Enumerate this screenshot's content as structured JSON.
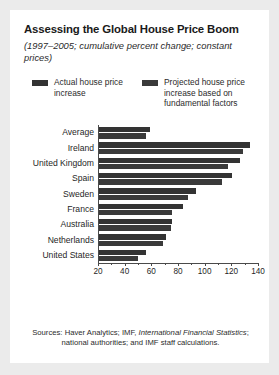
{
  "card": {
    "background": "#ffffff",
    "page_background": "#ebebeb"
  },
  "header": {
    "title": "Assessing the Global House Price Boom",
    "subtitle": "(1997–2005; cumulative percent change; constant prices)"
  },
  "legend": {
    "position": "top",
    "entries": [
      {
        "label": "Actual house price increase",
        "color": "#333333",
        "name": "actual"
      },
      {
        "label": "Projected house price increase based on fundamental factors",
        "color": "#3a3a3a",
        "name": "projected"
      }
    ]
  },
  "source": {
    "prefix": "Sources: Haver Analytics; IMF, ",
    "italic": "International Financial Statistics",
    "suffix": "; national authorities; and IMF staff calculations."
  },
  "chart_data": {
    "type": "bar",
    "orientation": "horizontal",
    "title": "Assessing the Global House Price Boom",
    "subtitle": "(1997–2005; cumulative percent change; constant prices)",
    "xlabel": "",
    "ylabel": "",
    "xlim": [
      20,
      140
    ],
    "xticks": [
      20,
      40,
      60,
      80,
      100,
      120,
      140
    ],
    "xtick_labels": [
      "20",
      "40",
      "60",
      "80",
      "100",
      "120",
      "140"
    ],
    "minor_ticks": [
      30,
      50,
      70,
      90,
      110,
      130
    ],
    "grid": false,
    "legend_position": "top",
    "categories": [
      "Average",
      "Ireland",
      "United Kingdom",
      "Spain",
      "Sweden",
      "France",
      "Australia",
      "Netherlands",
      "United States"
    ],
    "series": [
      {
        "name": "Actual house price increase",
        "color": "#333333",
        "values": [
          58,
          133,
          126,
          120,
          93,
          83,
          75,
          70,
          55
        ]
      },
      {
        "name": "Projected house price increase based on fundamental factors",
        "color": "#3a3a3a",
        "values": [
          55,
          128,
          117,
          112,
          87,
          75,
          74,
          68,
          49
        ]
      }
    ]
  }
}
